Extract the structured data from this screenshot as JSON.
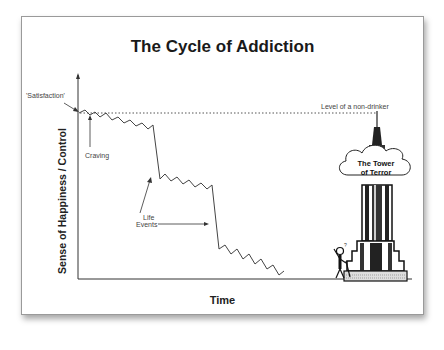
{
  "diagram": {
    "title": "The Cycle of Addiction",
    "axes": {
      "y_label": "Sense of Happiness / Control",
      "x_label": "Time"
    },
    "annotations": {
      "satisfaction": "'Satisfaction'",
      "craving": "Craving",
      "life_events": [
        "Life",
        "Events"
      ],
      "non_drinker_level": "Level of a non-drinker",
      "tower_label": [
        "The Tower",
        "of Terror"
      ]
    },
    "elements": {
      "zigzag_line": "declining-happiness-line",
      "reference_line": "dotted-non-drinker-line",
      "tower": "empire-state-building-icon",
      "person": "confused-person-icon"
    },
    "colors": {
      "line": "#444444",
      "text": "#1a1a1a",
      "frame": "#9a9a9a"
    }
  }
}
